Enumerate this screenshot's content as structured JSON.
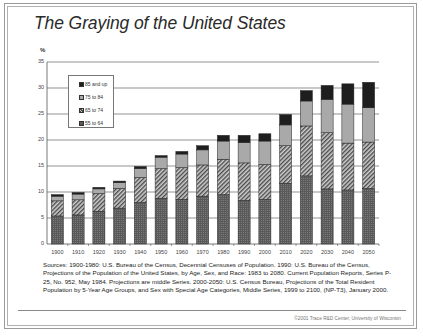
{
  "title": "The Graying of the United States",
  "chart_data": {
    "type": "bar",
    "stacked": true,
    "title": "The Graying of the United States",
    "xlabel": "",
    "ylabel": "%",
    "ylim": [
      0,
      35
    ],
    "yticks": [
      0,
      5,
      10,
      15,
      20,
      25,
      30,
      35
    ],
    "grid": true,
    "legend_position": "upper-left inside plot",
    "categories": [
      "1900",
      "1910",
      "1920",
      "1930",
      "1940",
      "1950",
      "1960",
      "1970",
      "1980",
      "1990",
      "2000",
      "2010",
      "2020",
      "2030",
      "2040",
      "2050"
    ],
    "series": [
      {
        "name": "55 to 64",
        "pattern": "dotted-dark",
        "values": [
          5.4,
          5.6,
          6.3,
          6.9,
          8.0,
          8.8,
          8.6,
          9.2,
          9.5,
          8.4,
          8.6,
          11.7,
          13.1,
          10.6,
          10.4,
          10.7
        ]
      },
      {
        "name": "65 to 74",
        "pattern": "diagonal-hatch",
        "values": [
          2.9,
          2.9,
          3.4,
          3.8,
          4.8,
          5.7,
          6.1,
          6.0,
          6.8,
          7.2,
          6.7,
          7.2,
          9.6,
          10.8,
          9.0,
          8.9
        ]
      },
      {
        "name": "75 to 84",
        "pattern": "light-gray",
        "values": [
          0.9,
          1.1,
          0.9,
          1.1,
          1.7,
          2.2,
          2.6,
          2.9,
          3.5,
          3.9,
          4.5,
          4.0,
          4.8,
          6.4,
          7.5,
          6.6
        ]
      },
      {
        "name": "85 and up",
        "pattern": "black",
        "values": [
          0.3,
          0.3,
          0.3,
          0.3,
          0.4,
          0.3,
          0.5,
          0.8,
          1.1,
          1.4,
          1.4,
          2.0,
          2.0,
          2.7,
          3.9,
          4.9
        ]
      }
    ],
    "legend": [
      "85 and up",
      "75 to 84",
      "65 to 74",
      "55 to 64"
    ]
  },
  "colors": {
    "seg_55_64": "#5a5a5a",
    "seg_65_74_bg": "#c8c8c8",
    "seg_65_74_hatch": "#4a4a4a",
    "seg_75_84": "#a9a9a9",
    "seg_85_up": "#1e1e1e",
    "gridline": "#666666"
  },
  "sources_text": "Sources: 1900-1980: U.S. Bureau of the Census, Decennial Censuses of Population. 1990: U.S. Bureau of the Census, Projections of the Population of the United States, by Age, Sex, and Race: 1983 to 2080. Current Population Reports, Series P-25, No. 952, May 1984. Projections are middle Series. 2000-2050: U.S. Census Bureau, Projections of the Total Resident Population by 5-Year Age Groups, and Sex with Special Age Categories, Middle Series, 1999 to 2100, (NP-T3), January 2000.",
  "footer": "©2001 Trace R&D Center, University of Wisconsin"
}
